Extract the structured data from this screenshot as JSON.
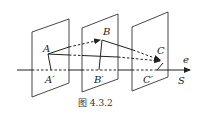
{
  "figure": {
    "caption": "图 4.3.2",
    "points": {
      "A": "A",
      "A_prime": "A′",
      "B": "B",
      "B_prime": "B′",
      "C": "C",
      "C_prime": "C′"
    },
    "axis": {
      "direction_label": "e",
      "name_label": "S"
    },
    "planes_count": 3
  }
}
